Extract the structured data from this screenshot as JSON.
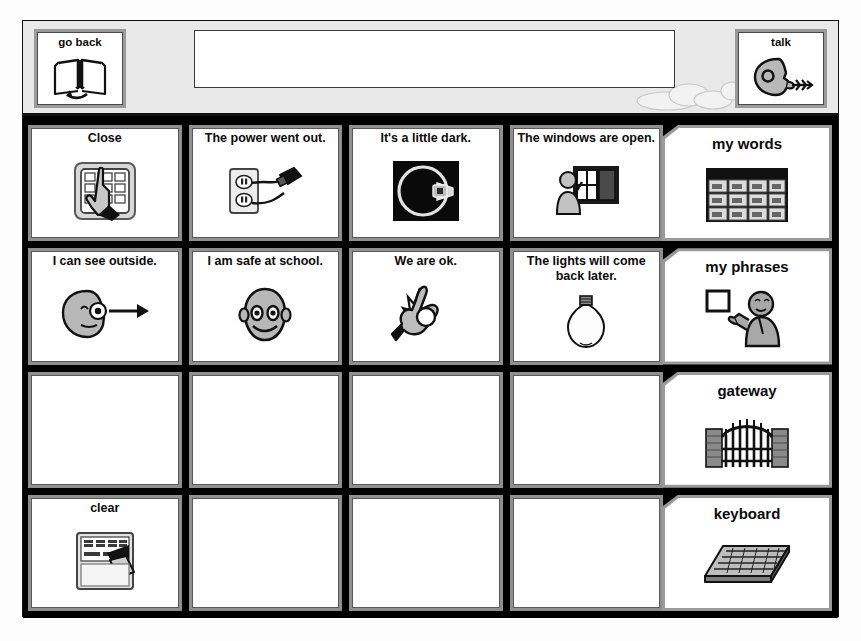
{
  "app": {
    "title": "Communication Board",
    "board_background": "#000000",
    "header_background": "#e9e9e9",
    "cell_frame_color": "#8f8f8f",
    "cell_face_color": "#ffffff",
    "text_color": "#0b0b0b"
  },
  "header": {
    "go_back": {
      "label": "go back",
      "icon": "open-book-back-icon"
    },
    "talk": {
      "label": "talk",
      "icon": "speaking-head-icon"
    },
    "message_bar": {
      "value": "",
      "placeholder": ""
    },
    "cloud": {
      "icon": "cloud-decoration-icon"
    }
  },
  "grid": {
    "columns": 4,
    "rows": 4,
    "cells": [
      {
        "label": "Close",
        "icon": "hand-pressing-device-icon",
        "empty": false
      },
      {
        "label": "The power went out.",
        "icon": "outlet-unplugged-cord-icon",
        "empty": false
      },
      {
        "label": "It's a little dark.",
        "icon": "dark-room-dimmer-icon",
        "empty": false
      },
      {
        "label": "The windows are open.",
        "icon": "person-at-open-window-icon",
        "empty": false
      },
      {
        "label": "I can see outside.",
        "icon": "head-looking-arrow-icon",
        "empty": false
      },
      {
        "label": "I am safe at school.",
        "icon": "smiling-face-icon",
        "empty": false
      },
      {
        "label": "We are ok.",
        "icon": "ok-hand-gesture-icon",
        "empty": false
      },
      {
        "label": "The lights will come back later.",
        "icon": "light-bulb-icon",
        "empty": false
      },
      {
        "label": "",
        "icon": "",
        "empty": true
      },
      {
        "label": "",
        "icon": "",
        "empty": true
      },
      {
        "label": "",
        "icon": "",
        "empty": true
      },
      {
        "label": "",
        "icon": "",
        "empty": true
      },
      {
        "label": "clear",
        "icon": "erase-board-icon",
        "empty": false
      },
      {
        "label": "",
        "icon": "",
        "empty": true
      },
      {
        "label": "",
        "icon": "",
        "empty": true
      },
      {
        "label": "",
        "icon": "",
        "empty": true
      }
    ]
  },
  "sidebar": {
    "items": [
      {
        "label": "my words",
        "icon": "picture-grid-icon"
      },
      {
        "label": "my phrases",
        "icon": "person-holding-card-icon"
      },
      {
        "label": "gateway",
        "icon": "iron-gate-icon"
      },
      {
        "label": "keyboard",
        "icon": "keyboard-icon"
      }
    ]
  }
}
